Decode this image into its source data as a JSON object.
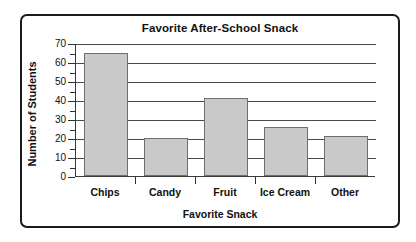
{
  "chart_data": {
    "type": "bar",
    "title": "Favorite After-School Snack",
    "xlabel": "Favorite Snack",
    "ylabel": "Number of Students",
    "categories": [
      "Chips",
      "Candy",
      "Fruit",
      "Ice Cream",
      "Other"
    ],
    "values": [
      65,
      20,
      41,
      26,
      21
    ],
    "ylim": [
      0,
      70
    ],
    "ytick_step": 10,
    "yminor_step": 5,
    "ytick_labels": [
      "0",
      "10",
      "20",
      "30",
      "40",
      "50",
      "60",
      "70"
    ],
    "grid": true,
    "legend": false,
    "bar_color": "#c9c9c9",
    "bar_edge_color": "#6f6f6f",
    "axis_color": "#2e2e2e",
    "text_color": "#111111",
    "background": "#ffffff"
  },
  "frame": {
    "border_color": "#1b1b1b"
  }
}
